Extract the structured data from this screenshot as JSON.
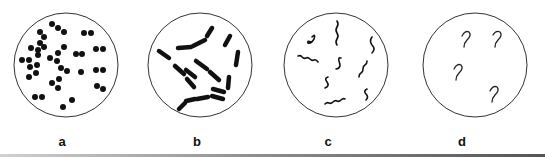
{
  "figure": {
    "panels": [
      {
        "id": "a",
        "label": "a",
        "shape": "cocci",
        "cx": 66,
        "cy": 65,
        "r": 52
      },
      {
        "id": "b",
        "label": "b",
        "shape": "bacilli",
        "cx": 200,
        "cy": 65,
        "r": 52
      },
      {
        "id": "c",
        "label": "c",
        "shape": "spirilla",
        "cx": 336,
        "cy": 65,
        "r": 52
      },
      {
        "id": "d",
        "label": "d",
        "shape": "vibrios",
        "cx": 475,
        "cy": 65,
        "r": 52
      }
    ],
    "colors": {
      "stroke": "#333333",
      "fill": "#111111",
      "background": "#ffffff"
    }
  }
}
